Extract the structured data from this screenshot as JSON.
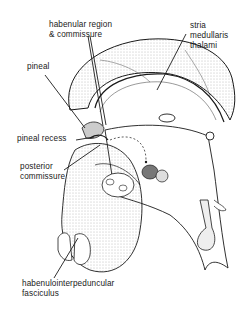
{
  "diagram": {
    "style": "pen-and-ink anatomical illustration",
    "colors": {
      "ink": "#1a1a1a",
      "shade": "#9a9a9a",
      "background": "#ffffff"
    },
    "labels": {
      "habenular": {
        "line1": "habenular region",
        "line2": "& commissure"
      },
      "stria": {
        "line1": "stria",
        "line2": "medullaris",
        "line3": "thalami"
      },
      "pineal": "pineal",
      "pineal_recess": "pineal recess",
      "posterior": {
        "line1": "posterior",
        "line2": "commissure"
      },
      "hip": {
        "line1": "habenulointerpeduncular",
        "line2": "fasciculus"
      }
    }
  }
}
